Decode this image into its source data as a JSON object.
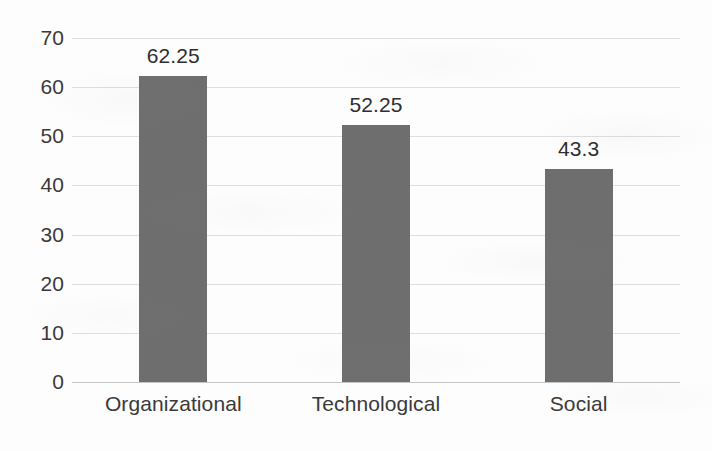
{
  "chart_data": {
    "type": "bar",
    "title": "",
    "subtitle": "",
    "xlabel": "",
    "ylabel": "",
    "categories": [
      "Organizational",
      "Technological",
      "Social"
    ],
    "values": [
      62.25,
      52.25,
      43.3
    ],
    "value_labels": [
      "62.25",
      "52.25",
      "43.3"
    ],
    "ylim": [
      0,
      70
    ],
    "ytick_values": [
      0,
      10,
      20,
      30,
      40,
      50,
      60,
      70
    ],
    "ytick_labels": [
      "0",
      "10",
      "20",
      "30",
      "40",
      "50",
      "60",
      "70"
    ],
    "grid": "horizontal",
    "legend": "none",
    "bar_color": "#6e6e6e",
    "gridline_color": "#d8d8d8",
    "axis_color": "#b9b9b9",
    "text_color": "#3a3a3a",
    "background_color": "#fdfdfd",
    "series": [
      {
        "name": "Values",
        "values": [
          62.25,
          52.25,
          43.3
        ]
      }
    ]
  }
}
